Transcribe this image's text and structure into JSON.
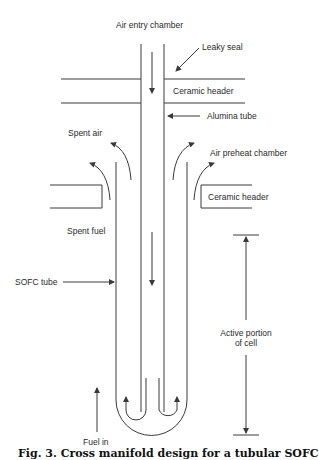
{
  "labels": {
    "air_entry_chamber": "Air entry chamber",
    "leaky_seal": "Leaky seal",
    "ceramic_header_top": "Ceramic header",
    "alumina_tube": "Alumina tube",
    "spent_air": "Spent air",
    "air_preheat_chamber": "Air preheat chamber",
    "ceramic_header_side": "Ceramic header",
    "spent_fuel": "Spent fuel",
    "sofc_tube": "SOFC tube",
    "active_portion_line1": "Active portion",
    "active_portion_line2": "of cell",
    "fuel_in": "Fuel in"
  },
  "caption": "Fig. 3. Cross manifold design for a tubular SOFC",
  "colors": {
    "line": "#3a3a3a",
    "text": "#2a2a2a",
    "background": "#ffffff"
  }
}
